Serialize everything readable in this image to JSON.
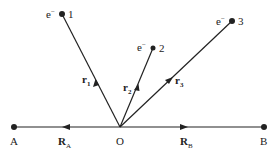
{
  "diagram": {
    "line_color": "#222222",
    "points": {
      "A": {
        "label": "A",
        "x": 14,
        "y": 127
      },
      "O": {
        "label": "O",
        "x": 120,
        "y": 127
      },
      "B": {
        "label": "B",
        "x": 264,
        "y": 127
      },
      "e1": {
        "label": "1",
        "charge": "e",
        "sup": "−",
        "x": 62,
        "y": 14
      },
      "e2": {
        "label": "2",
        "charge": "e",
        "sup": "−",
        "x": 153,
        "y": 48
      },
      "e3": {
        "label": "3",
        "charge": "e",
        "sup": "−",
        "x": 232,
        "y": 21
      }
    },
    "vectors": {
      "r1": {
        "label": "r",
        "sub": "1"
      },
      "r2": {
        "label": "r",
        "sub": "2"
      },
      "r3": {
        "label": "r",
        "sub": "3"
      },
      "RA": {
        "label": "R",
        "sub": "A"
      },
      "RB": {
        "label": "R",
        "sub": "B"
      }
    }
  }
}
